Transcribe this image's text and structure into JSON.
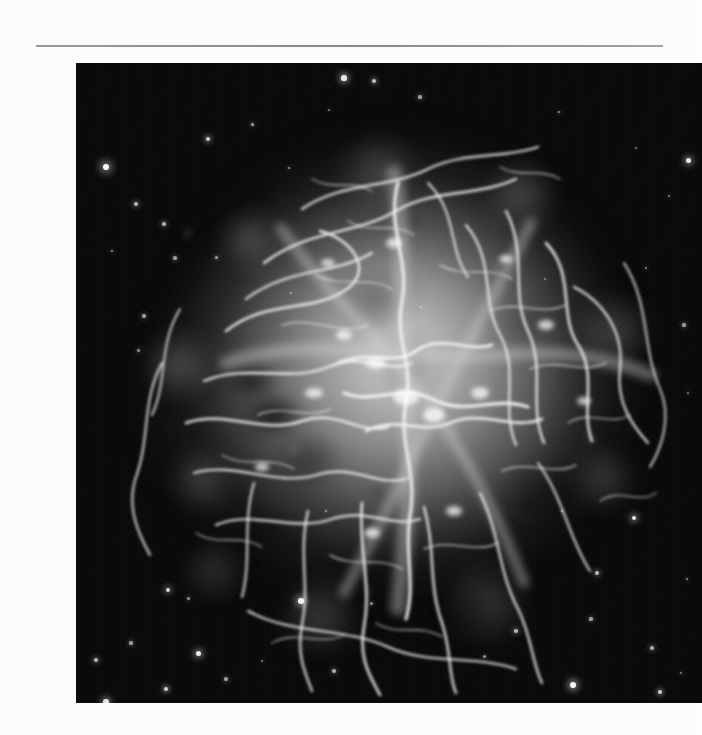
{
  "page": {
    "background_color": "#fcfcfc",
    "type": "scanned-photographic-plate",
    "caption": ""
  },
  "plate": {
    "name": "crab-nebula-photograph",
    "alt_text": "Crab Nebula supernova remnant, grayscale astronomical photograph",
    "x": 36,
    "y": 47,
    "width": 626,
    "height": 640,
    "background_color": "#050505",
    "nebula_color_bright": "#e8e8e8",
    "nebula_color_mid": "#9a9a9a",
    "nebula_color_dim": "#3c3c3c",
    "star_color": "#ffffff"
  },
  "scan_artifacts": {
    "top_rule_visible": true,
    "top_rule_y": 45,
    "paper_noise": true
  },
  "stars": [
    {
      "x": 30,
      "y": 104,
      "r": 3.4,
      "b": 1.0
    },
    {
      "x": 132,
      "y": 76,
      "r": 2.1,
      "b": 0.8
    },
    {
      "x": 176,
      "y": 61,
      "r": 1.5,
      "b": 0.6
    },
    {
      "x": 213,
      "y": 105,
      "r": 1.4,
      "b": 0.55
    },
    {
      "x": 268,
      "y": 15,
      "r": 2.6,
      "b": 0.9
    },
    {
      "x": 298,
      "y": 18,
      "r": 2.0,
      "b": 0.75
    },
    {
      "x": 344,
      "y": 34,
      "r": 1.6,
      "b": 0.6
    },
    {
      "x": 253,
      "y": 47,
      "r": 1.3,
      "b": 0.5
    },
    {
      "x": 60,
      "y": 141,
      "r": 1.9,
      "b": 0.7
    },
    {
      "x": 88,
      "y": 161,
      "r": 1.8,
      "b": 0.68
    },
    {
      "x": 36,
      "y": 188,
      "r": 1.4,
      "b": 0.55
    },
    {
      "x": 99,
      "y": 195,
      "r": 1.6,
      "b": 0.6
    },
    {
      "x": 140,
      "y": 194,
      "r": 1.5,
      "b": 0.58
    },
    {
      "x": 68,
      "y": 253,
      "r": 1.6,
      "b": 0.58
    },
    {
      "x": 62,
      "y": 287,
      "r": 1.5,
      "b": 0.55
    },
    {
      "x": 483,
      "y": 49,
      "r": 1.4,
      "b": 0.55
    },
    {
      "x": 560,
      "y": 85,
      "r": 1.2,
      "b": 0.45
    },
    {
      "x": 612,
      "y": 97,
      "r": 2.5,
      "b": 0.92
    },
    {
      "x": 593,
      "y": 133,
      "r": 1.3,
      "b": 0.48
    },
    {
      "x": 570,
      "y": 205,
      "r": 1.4,
      "b": 0.52
    },
    {
      "x": 608,
      "y": 262,
      "r": 1.6,
      "b": 0.6
    },
    {
      "x": 612,
      "y": 330,
      "r": 1.3,
      "b": 0.48
    },
    {
      "x": 558,
      "y": 455,
      "r": 2.4,
      "b": 0.9
    },
    {
      "x": 521,
      "y": 510,
      "r": 1.9,
      "b": 0.72
    },
    {
      "x": 515,
      "y": 556,
      "r": 1.6,
      "b": 0.6
    },
    {
      "x": 576,
      "y": 585,
      "r": 1.7,
      "b": 0.65
    },
    {
      "x": 611,
      "y": 516,
      "r": 1.4,
      "b": 0.52
    },
    {
      "x": 605,
      "y": 610,
      "r": 1.3,
      "b": 0.48
    },
    {
      "x": 497,
      "y": 622,
      "r": 3.0,
      "b": 0.98
    },
    {
      "x": 584,
      "y": 629,
      "r": 2.1,
      "b": 0.8
    },
    {
      "x": 486,
      "y": 448,
      "r": 1.4,
      "b": 0.52
    },
    {
      "x": 440,
      "y": 568,
      "r": 1.8,
      "b": 0.68
    },
    {
      "x": 408,
      "y": 593,
      "r": 1.5,
      "b": 0.55
    },
    {
      "x": 258,
      "y": 608,
      "r": 1.7,
      "b": 0.62
    },
    {
      "x": 186,
      "y": 598,
      "r": 1.3,
      "b": 0.48
    },
    {
      "x": 150,
      "y": 616,
      "r": 1.6,
      "b": 0.58
    },
    {
      "x": 122,
      "y": 590,
      "r": 2.5,
      "b": 0.92
    },
    {
      "x": 90,
      "y": 626,
      "r": 2.2,
      "b": 0.82
    },
    {
      "x": 30,
      "y": 639,
      "r": 2.6,
      "b": 0.88
    },
    {
      "x": 20,
      "y": 597,
      "r": 1.9,
      "b": 0.7
    },
    {
      "x": 55,
      "y": 580,
      "r": 1.6,
      "b": 0.6
    },
    {
      "x": 112,
      "y": 535,
      "r": 1.5,
      "b": 0.55
    },
    {
      "x": 92,
      "y": 527,
      "r": 2.3,
      "b": 0.84
    },
    {
      "x": 225,
      "y": 538,
      "r": 2.7,
      "b": 0.95
    },
    {
      "x": 295,
      "y": 540,
      "r": 1.5,
      "b": 0.55
    },
    {
      "x": 250,
      "y": 448,
      "r": 1.4,
      "b": 0.5
    },
    {
      "x": 332,
      "y": 415,
      "r": 1.3,
      "b": 0.45
    },
    {
      "x": 215,
      "y": 230,
      "r": 1.2,
      "b": 0.42
    },
    {
      "x": 345,
      "y": 244,
      "r": 1.2,
      "b": 0.42
    },
    {
      "x": 469,
      "y": 216,
      "r": 1.2,
      "b": 0.42
    }
  ],
  "chart_data": null
}
